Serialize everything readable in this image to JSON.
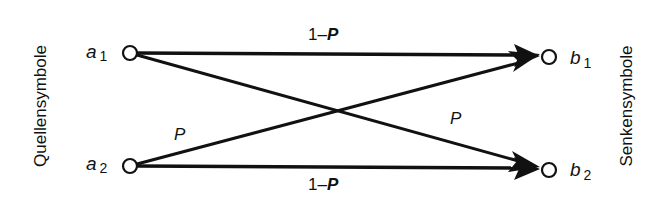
{
  "diagram": {
    "type": "binary-symmetric-channel",
    "left_axis_label": "Quellensymbole",
    "right_axis_label": "Senkensymbole",
    "sources": [
      {
        "id": "a1",
        "base": "a",
        "sub": "1"
      },
      {
        "id": "a2",
        "base": "a",
        "sub": "2"
      }
    ],
    "sinks": [
      {
        "id": "b1",
        "base": "b",
        "sub": "1"
      },
      {
        "id": "b2",
        "base": "b",
        "sub": "2"
      }
    ],
    "edges": [
      {
        "from": "a1",
        "to": "b1",
        "label_prefix": "1–",
        "label_var": "P"
      },
      {
        "from": "a1",
        "to": "b2",
        "label_prefix": "",
        "label_var": "P"
      },
      {
        "from": "a2",
        "to": "b1",
        "label_prefix": "",
        "label_var": "P"
      },
      {
        "from": "a2",
        "to": "b2",
        "label_prefix": "1–",
        "label_var": "P"
      }
    ],
    "colors": {
      "stroke": "#111111",
      "background": "#ffffff"
    }
  }
}
